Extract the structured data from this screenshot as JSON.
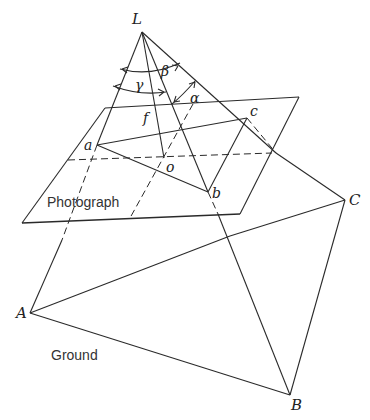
{
  "diagram": {
    "points": {
      "L": {
        "label": "L",
        "x": 142,
        "y": 32
      },
      "a": {
        "label": "a",
        "x": 97,
        "y": 145
      },
      "o": {
        "label": "o",
        "x": 164,
        "y": 158
      },
      "b": {
        "label": "b",
        "x": 208,
        "y": 192
      },
      "c": {
        "label": "c",
        "x": 247,
        "y": 118
      },
      "A": {
        "label": "A",
        "x": 30,
        "y": 313
      },
      "B": {
        "label": "B",
        "x": 290,
        "y": 395
      },
      "C": {
        "label": "C",
        "x": 345,
        "y": 200
      }
    },
    "angles": {
      "alpha": "α",
      "beta": "β",
      "gamma": "γ"
    },
    "focal_length": "f",
    "planes": {
      "photograph": "Photograph",
      "ground": "Ground"
    }
  }
}
